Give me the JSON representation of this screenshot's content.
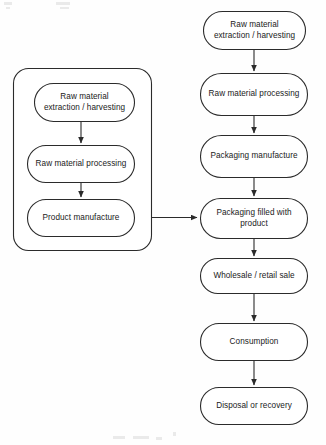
{
  "diagram": {
    "type": "flowchart",
    "orientation": "vertical",
    "colors": {
      "background": "#fefefe",
      "node_fill": "#ffffff",
      "stroke": "#2b2b2b",
      "text": "#1a1a1a"
    },
    "group": {
      "name": "product-system-group",
      "label": "",
      "x": 13,
      "y": 68,
      "width": 139,
      "height": 183
    },
    "left_column": {
      "name": "product-life-cycle-column",
      "nodes": [
        {
          "id": "l1",
          "label": "Raw material\nextraction / harvesting",
          "x": 34,
          "y": 83,
          "width": 101,
          "height": 39
        },
        {
          "id": "l2",
          "label": "Raw material processing",
          "x": 27,
          "y": 145,
          "width": 108,
          "height": 38
        },
        {
          "id": "l3",
          "label": "Product manufacture",
          "x": 27,
          "y": 199,
          "width": 108,
          "height": 38
        }
      ],
      "arrows": [
        {
          "from": "l1",
          "to": "l2"
        },
        {
          "from": "l2",
          "to": "l3"
        }
      ]
    },
    "right_column": {
      "name": "packaging-life-cycle-column",
      "nodes": [
        {
          "id": "r1",
          "label": "Raw material\nextraction / harvesting",
          "x": 203,
          "y": 11,
          "width": 103,
          "height": 39
        },
        {
          "id": "r2",
          "label": "Raw material processing",
          "x": 200,
          "y": 73,
          "width": 108,
          "height": 43
        },
        {
          "id": "r3",
          "label": "Packaging manufacture",
          "x": 200,
          "y": 135,
          "width": 108,
          "height": 43
        },
        {
          "id": "r4",
          "label": "Packaging filled with\nproduct",
          "x": 200,
          "y": 198,
          "width": 108,
          "height": 41
        },
        {
          "id": "r5",
          "label": "Wholesale / retail sale",
          "x": 200,
          "y": 258,
          "width": 108,
          "height": 36
        },
        {
          "id": "r6",
          "label": "Consumption",
          "x": 200,
          "y": 323,
          "width": 108,
          "height": 38
        },
        {
          "id": "r7",
          "label": "Disposal or recovery",
          "x": 200,
          "y": 387,
          "width": 108,
          "height": 38
        }
      ],
      "arrows": [
        {
          "from": "r1",
          "to": "r2"
        },
        {
          "from": "r2",
          "to": "r3"
        },
        {
          "from": "r3",
          "to": "r4"
        },
        {
          "from": "r4",
          "to": "r5"
        },
        {
          "from": "r5",
          "to": "r6"
        },
        {
          "from": "r6",
          "to": "r7"
        }
      ]
    },
    "cross_arrow": {
      "name": "product-to-packaging-filling-arrow",
      "label": "",
      "from": "product-system-group",
      "to": "r4",
      "x1": 152,
      "y1": 217,
      "x2": 199,
      "y2": 217
    }
  },
  "artifacts": {
    "scan_noise": [
      {
        "x": 4,
        "y": 2,
        "width": 8,
        "height": 3
      },
      {
        "x": 6,
        "y": 7,
        "width": 4,
        "height": 2
      },
      {
        "x": 56,
        "y": 2,
        "width": 14,
        "height": 3
      },
      {
        "x": 60,
        "y": 7,
        "width": 9,
        "height": 2
      },
      {
        "x": 113,
        "y": 436,
        "width": 12,
        "height": 3
      },
      {
        "x": 133,
        "y": 436,
        "width": 16,
        "height": 3
      },
      {
        "x": 156,
        "y": 437,
        "width": 6,
        "height": 3
      },
      {
        "x": 173,
        "y": 432,
        "width": 3,
        "height": 4
      }
    ]
  }
}
